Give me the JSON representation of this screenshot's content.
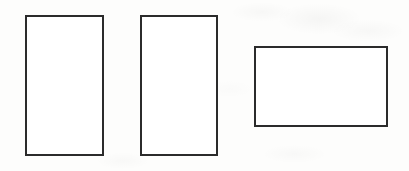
{
  "figure": {
    "kind": "line-drawing",
    "canvas": {
      "width": 409,
      "height": 171,
      "background_color": "#fdfdfc",
      "paper_tone": "off-white scanned paper with faint bleed-through mottling"
    },
    "stroke": {
      "color": "#2b2b2b",
      "width_px": 2,
      "style": "solid"
    },
    "shapes": [
      {
        "id": "rectangle-1",
        "label": "Rectangle 1",
        "orientation": "portrait",
        "fill_color": "#ffffff",
        "border_color": "#2b2b2b",
        "x": 25,
        "y": 15,
        "width": 79,
        "height": 141
      },
      {
        "id": "rectangle-2",
        "label": "Rectangle 2",
        "orientation": "portrait",
        "fill_color": "#ffffff",
        "border_color": "#2b2b2b",
        "x": 140,
        "y": 15,
        "width": 78,
        "height": 141
      },
      {
        "id": "rectangle-3",
        "label": "Rectangle 3",
        "orientation": "landscape",
        "fill_color": "#ffffff",
        "border_color": "#2b2b2b",
        "x": 254,
        "y": 46,
        "width": 134,
        "height": 81
      }
    ]
  }
}
